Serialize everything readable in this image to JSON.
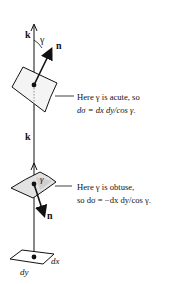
{
  "diagram": {
    "top_case": {
      "axis_label": "k",
      "angle_label": "γ",
      "normal_label": "n",
      "caption_line1": "Here γ is acute, so",
      "caption_line2": "dσ = dx dy/cos γ."
    },
    "bottom_case": {
      "axis_label": "k",
      "angle_label": "γ",
      "normal_label": "n",
      "caption_line1": "Here γ is obtuse,",
      "caption_line2": "so dσ = −dx dy/cos γ."
    },
    "base_element": {
      "dx_label": "dx",
      "dy_label": "dy"
    },
    "colors": {
      "line": "#111111",
      "patch_shade": "#cfcfcf",
      "background": "#ffffff"
    }
  }
}
